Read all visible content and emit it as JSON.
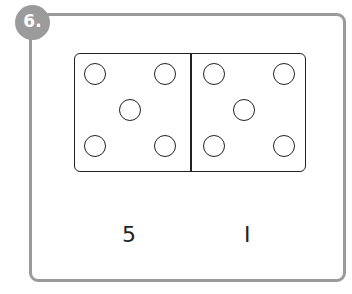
{
  "badge": {
    "label": "6."
  },
  "domino": {
    "left_half": {
      "pips": 5
    },
    "right_half": {
      "pips": 5
    }
  },
  "answers": [
    {
      "label": "5"
    },
    {
      "label": "I"
    }
  ],
  "colors": {
    "frame": "#9b9b9b",
    "ink": "#222222"
  }
}
